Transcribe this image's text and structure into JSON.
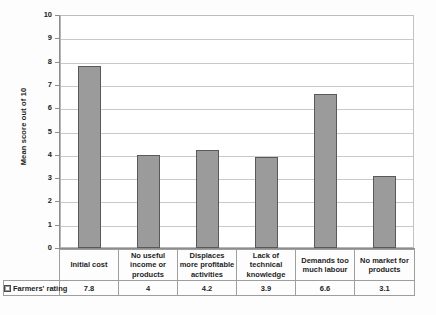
{
  "chart_data": {
    "type": "bar",
    "title": "",
    "subtitle": "",
    "xlabel": "",
    "ylabel": "Mean score out of 10",
    "ylim": [
      0,
      10
    ],
    "y_ticks": [
      "0",
      "1",
      "2",
      "3",
      "4",
      "5",
      "6",
      "7",
      "8",
      "9",
      "10"
    ],
    "grid": true,
    "legend_position": "table-row-header",
    "categories": [
      "Initial cost",
      "No useful income or products",
      "Displaces more profitable activities",
      "Lack of technical knowledge",
      "Demands too much labour",
      "No market for products"
    ],
    "category_lines": [
      [
        "Initial cost"
      ],
      [
        "No useful",
        "income or",
        "products"
      ],
      [
        "Displaces",
        "more profitable",
        "activities"
      ],
      [
        "Lack of",
        "technical",
        "knowledge"
      ],
      [
        "Demands too",
        "much labour"
      ],
      [
        "No market for",
        "products"
      ]
    ],
    "series": [
      {
        "name": "Farmers' rating",
        "values": [
          7.8,
          4,
          4.2,
          3.9,
          6.6,
          3.1
        ],
        "value_labels": [
          "7.8",
          "4",
          "4.2",
          "3.9",
          "6.6",
          "3.1"
        ],
        "color": "#9b9b9b",
        "border_color": "#595959"
      }
    ]
  },
  "legend": {
    "label": "Farmers' rating",
    "swatch_name": "series-color-swatch"
  },
  "colors": {
    "bar_fill": "#9b9b9b",
    "bar_border": "#595959",
    "gridline": "#c9c9c9",
    "axis": "#8d8d8d",
    "table_border": "#9e9e9e",
    "text": "#1d1d1d",
    "background": "#ffffff"
  }
}
